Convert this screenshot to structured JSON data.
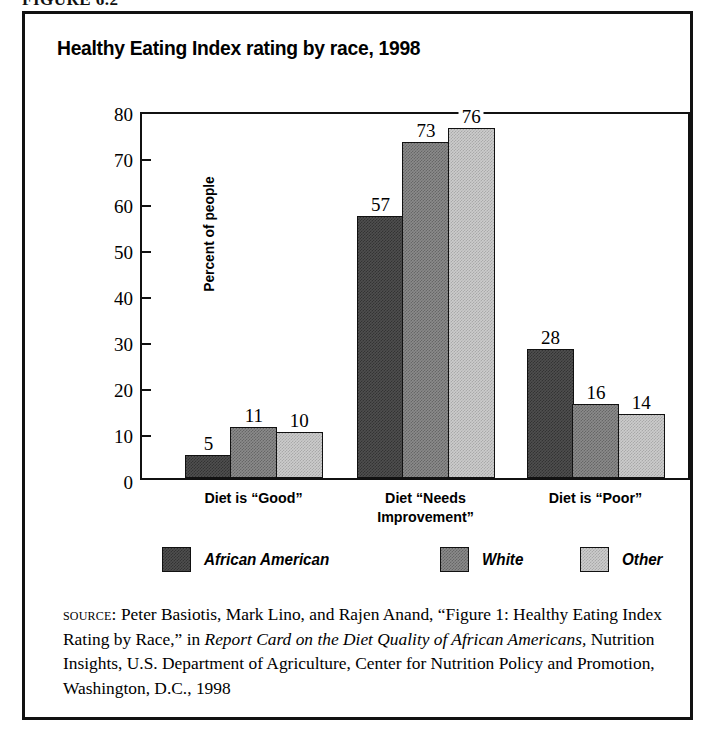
{
  "figure": {
    "caption": "FIGURE 6.2"
  },
  "chart_data": {
    "type": "bar",
    "title": "Healthy Eating Index rating by race, 1998",
    "xlabel": "",
    "ylabel": "Percent of people",
    "ylim": [
      0,
      80
    ],
    "ytick_step": 10,
    "yticks": [
      "0",
      "10",
      "20",
      "30",
      "40",
      "50",
      "60",
      "70",
      "80"
    ],
    "grid": false,
    "legend_position": "bottom",
    "categories": [
      "Diet is “Good”",
      "Diet “Needs Improvement”",
      "Diet is “Poor”"
    ],
    "categories_lines": [
      [
        "Diet is “Good”"
      ],
      [
        "Diet “Needs",
        "Improvement”"
      ],
      [
        "Diet is “Poor”"
      ]
    ],
    "series": [
      {
        "name": "African American",
        "color": "#4f4f4f",
        "fill": "fill-dark",
        "values": [
          5,
          57,
          28
        ]
      },
      {
        "name": "White",
        "color": "#8b8b8b",
        "fill": "fill-medium",
        "values": [
          11,
          73,
          16
        ]
      },
      {
        "name": "Other",
        "color": "#cccccc",
        "fill": "fill-light",
        "values": [
          10,
          76,
          14
        ]
      }
    ],
    "data_labels": [
      "5",
      "11",
      "10",
      "57",
      "73",
      "76",
      "28",
      "16",
      "14"
    ]
  },
  "source": {
    "label": "source:",
    "part1": " Peter Basiotis, Mark Lino, and Rajen Anand, “Figure 1: Healthy Eating Index Rating by Race,” in ",
    "italic1": "Report Card on the Diet Quality of African Americans,",
    "part2": " Nutrition Insights, U.S. Department of Agriculture, Center for Nutrition Policy and Promotion, Washington, D.C., 1998"
  }
}
